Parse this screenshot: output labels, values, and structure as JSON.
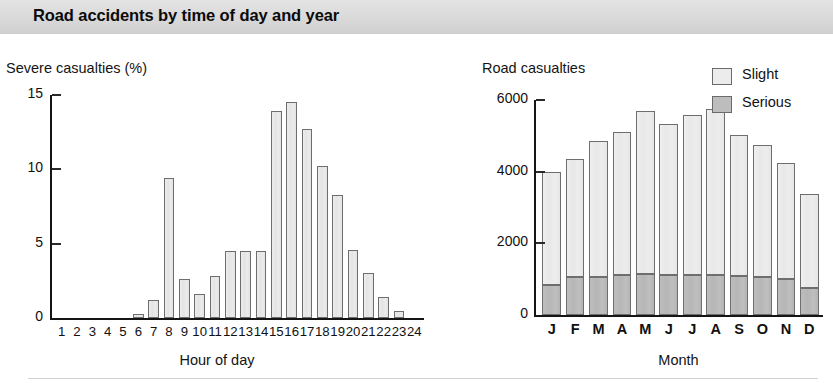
{
  "title": "Road accidents by time of day and year",
  "legend": {
    "items": [
      {
        "label": "Slight",
        "color": "#ececec"
      },
      {
        "label": "Serious",
        "color": "#bdbdbd"
      }
    ]
  },
  "left_chart": {
    "y_axis_title": "Severe casualties (%)",
    "x_axis_title": "Hour of day"
  },
  "right_chart": {
    "y_axis_title": "Road casualties",
    "x_axis_title": "Month"
  },
  "chart_data": [
    {
      "type": "bar",
      "title": "Severe casualties (%)",
      "ylabel": "Severe casualties (%)",
      "xlabel": "Hour of day",
      "ylim": [
        0,
        15
      ],
      "yticks": [
        0,
        5,
        10,
        15
      ],
      "ytick_labels": [
        "0",
        "5",
        "10",
        "15"
      ],
      "grid": false,
      "legend_position": "none",
      "categories": [
        "1",
        "2",
        "3",
        "4",
        "5",
        "6",
        "7",
        "8",
        "9",
        "10",
        "11",
        "12",
        "13",
        "14",
        "15",
        "16",
        "17",
        "18",
        "19",
        "20",
        "21",
        "22",
        "23",
        "24"
      ],
      "values": [
        0,
        0,
        0,
        0,
        0,
        0.3,
        1.2,
        9.4,
        2.6,
        1.6,
        2.8,
        4.5,
        4.5,
        4.5,
        13.9,
        14.5,
        12.7,
        10.2,
        8.3,
        4.6,
        3.0,
        1.4,
        0.5,
        0
      ]
    },
    {
      "type": "bar",
      "title": "Road casualties",
      "ylabel": "Road casualties",
      "xlabel": "Month",
      "ylim": [
        0,
        6000
      ],
      "yticks": [
        0,
        2000,
        4000,
        6000
      ],
      "ytick_labels": [
        "0",
        "2000",
        "4000",
        "6000"
      ],
      "grid": false,
      "stacked": true,
      "legend_position": "top-right",
      "categories": [
        "J",
        "F",
        "M",
        "A",
        "M",
        "J",
        "J",
        "A",
        "S",
        "O",
        "N",
        "D"
      ],
      "series": [
        {
          "name": "Serious",
          "values": [
            830,
            1050,
            1070,
            1110,
            1140,
            1130,
            1130,
            1130,
            1100,
            1050,
            1000,
            760
          ]
        },
        {
          "name": "Slight",
          "values": [
            3170,
            3300,
            3790,
            3990,
            4540,
            4200,
            4440,
            4620,
            3930,
            3690,
            3240,
            2630
          ]
        }
      ],
      "totals": [
        4000,
        4350,
        4860,
        5100,
        5680,
        5330,
        5570,
        5750,
        5030,
        4740,
        4240,
        3390
      ]
    }
  ]
}
